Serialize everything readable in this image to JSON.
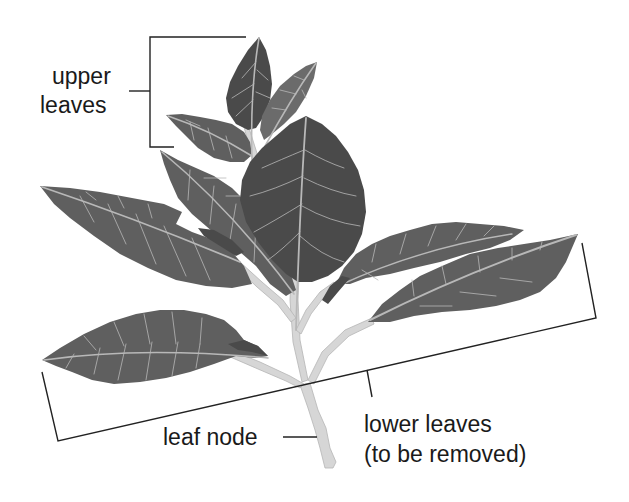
{
  "diagram": {
    "labels": {
      "upper_leaves_line1": "upper",
      "upper_leaves_line2": "leaves",
      "leaf_node": "leaf node",
      "lower_leaves_line1": "lower leaves",
      "lower_leaves_line2": "(to be removed)"
    },
    "colors": {
      "background": "#ffffff",
      "leaf": "#5f5f5f",
      "leaf_dark": "#4a4a4a",
      "vein": "#b8b8b8",
      "stem": "#d6d6d6",
      "bracket": "#222222",
      "text": "#1a1a1a"
    }
  }
}
